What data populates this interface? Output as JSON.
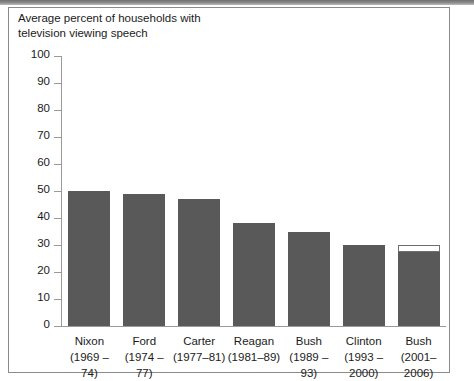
{
  "figure": {
    "title": "Average percent of households with\ntelevision viewing speech",
    "bar_color": "#595959",
    "axis_color": "#9a9a9a",
    "frame_color": "#8b8b8b",
    "background": "#ffffff"
  },
  "chart_data": {
    "type": "bar",
    "title": "Average percent of households with television viewing speech",
    "xlabel": "",
    "ylabel": "",
    "ylim": [
      0,
      100
    ],
    "ytick_step": 10,
    "yticks": [
      0,
      10,
      20,
      30,
      40,
      50,
      60,
      70,
      80,
      90,
      100
    ],
    "grid": false,
    "legend": false,
    "categories": [
      "Nixon (1969 –74)",
      "Ford (1974 –77)",
      "Carter (1977–81)",
      "Reagan (1981–89)",
      "Bush (1989 –93)",
      "Clinton (1993 –2000)",
      "Bush (2001–2006)"
    ],
    "names": [
      "Nixon",
      "Ford",
      "Carter",
      "Reagan",
      "Bush",
      "Clinton",
      "Bush"
    ],
    "terms": [
      "(1969 –74)",
      "(1974 –77)",
      "(1977–81)",
      "(1981–89)",
      "(1989 –93)",
      "(1993 –2000)",
      "(2001–2006)"
    ],
    "values": [
      50,
      49,
      47,
      38,
      35,
      30,
      27.5
    ],
    "extra_values": [
      0,
      0,
      0,
      0,
      0,
      0,
      2.5
    ],
    "extra_tops": [
      0,
      0,
      0,
      0,
      0,
      0,
      30
    ]
  }
}
